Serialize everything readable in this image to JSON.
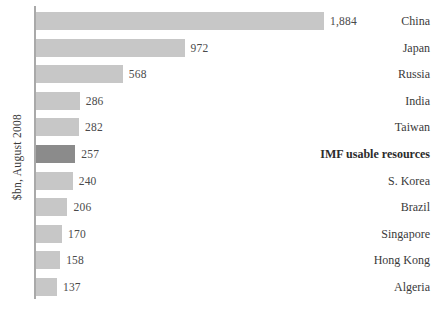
{
  "chart_data": {
    "type": "bar",
    "orientation": "horizontal",
    "title": "",
    "xlabel": "",
    "ylabel": "$bn, August 2008",
    "categories": [
      "China",
      "Japan",
      "Russia",
      "India",
      "Taiwan",
      "IMF usable resources",
      "S. Korea",
      "Brazil",
      "Singapore",
      "Hong Kong",
      "Algeria"
    ],
    "values": [
      1884,
      972,
      568,
      286,
      282,
      257,
      240,
      206,
      170,
      158,
      137
    ],
    "value_labels": [
      "1,884",
      "972",
      "568",
      "286",
      "282",
      "257",
      "240",
      "206",
      "170",
      "158",
      "137"
    ],
    "highlight_index": 5,
    "bold_labels": [
      5
    ],
    "xlim": [
      0,
      1884
    ],
    "grid": false,
    "legend": "none",
    "colors": {
      "bar": "#c7c7c7",
      "bar_highlight": "#8b8b8b",
      "axis": "#a9a9a9",
      "text": "#3a3a3a",
      "background": "#ffffff"
    }
  }
}
